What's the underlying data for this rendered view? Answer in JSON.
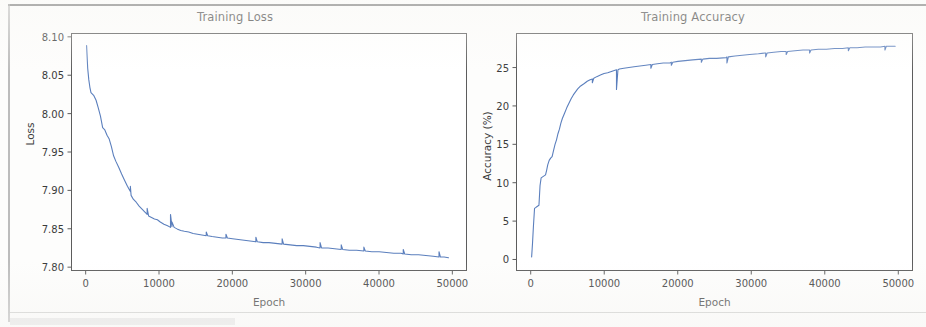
{
  "page": {
    "background_color": "#fdfdfc",
    "ink_color": "#3b3b3b"
  },
  "charts": {
    "loss": {
      "title": "Training Loss",
      "xlabel": "Epoch",
      "ylabel": "Loss"
    },
    "accuracy": {
      "title": "Training Accuracy",
      "xlabel": "Epoch",
      "ylabel": "Accuracy (%)"
    }
  },
  "chart_data": [
    {
      "type": "line",
      "title": "Training Loss",
      "xlabel": "Epoch",
      "ylabel": "Loss",
      "line_color": "#5b7fbd",
      "grid": false,
      "legend": null,
      "xlim": [
        -2000,
        52000
      ],
      "ylim": [
        7.795,
        8.105
      ],
      "xticks": [
        0,
        10000,
        20000,
        30000,
        40000,
        50000
      ],
      "xticklabels": [
        "0",
        "10000",
        "20000",
        "30000",
        "40000",
        "50000"
      ],
      "yticks": [
        7.8,
        7.85,
        7.9,
        7.95,
        8.0,
        8.05,
        8.1
      ],
      "yticklabels": [
        "7.80",
        "7.85",
        "7.90",
        "7.95",
        "8.00",
        "8.05",
        "8.10"
      ],
      "series": [
        {
          "name": "loss",
          "x": [
            0,
            150,
            300,
            450,
            600,
            800,
            1000,
            1300,
            1600,
            1900,
            2200,
            2500,
            2800,
            3100,
            3400,
            3700,
            4000,
            4400,
            4800,
            5200,
            5600,
            6000,
            6000,
            6100,
            6400,
            6800,
            7200,
            7600,
            8000,
            8300,
            8300,
            8500,
            8900,
            9300,
            9700,
            10100,
            10600,
            11100,
            11500,
            11500,
            11700,
            11700,
            12000,
            12400,
            12900,
            13400,
            14000,
            14600,
            15200,
            15800,
            16400,
            16400,
            16600,
            17200,
            17900,
            18600,
            19100,
            19100,
            19300,
            20000,
            20800,
            21600,
            22400,
            23200,
            23200,
            23400,
            24200,
            25000,
            25900,
            26800,
            26800,
            27000,
            27900,
            28800,
            29700,
            30600,
            31500,
            32000,
            32000,
            32200,
            33100,
            34000,
            34900,
            34900,
            35100,
            36000,
            37000,
            38000,
            38000,
            38200,
            39100,
            40100,
            41100,
            42100,
            43100,
            43400,
            43400,
            43600,
            44500,
            45500,
            46500,
            47500,
            48300,
            48300,
            48500,
            49000,
            49600
          ],
          "y": [
            8.09,
            8.06,
            8.045,
            8.035,
            8.028,
            8.026,
            8.024,
            8.018,
            8.008,
            7.997,
            7.982,
            7.979,
            7.972,
            7.967,
            7.957,
            7.945,
            7.938,
            7.93,
            7.921,
            7.913,
            7.905,
            7.898,
            7.905,
            7.893,
            7.888,
            7.884,
            7.879,
            7.875,
            7.871,
            7.868,
            7.876,
            7.866,
            7.864,
            7.862,
            7.861,
            7.858,
            7.855,
            7.853,
            7.851,
            7.868,
            7.852,
            7.858,
            7.851,
            7.849,
            7.847,
            7.846,
            7.845,
            7.843,
            7.842,
            7.841,
            7.84,
            7.845,
            7.84,
            7.839,
            7.838,
            7.837,
            7.837,
            7.842,
            7.837,
            7.836,
            7.835,
            7.834,
            7.833,
            7.832,
            7.838,
            7.832,
            7.831,
            7.831,
            7.83,
            7.829,
            7.836,
            7.829,
            7.828,
            7.827,
            7.827,
            7.826,
            7.825,
            7.824,
            7.831,
            7.824,
            7.824,
            7.823,
            7.822,
            7.828,
            7.822,
            7.821,
            7.821,
            7.82,
            7.825,
            7.82,
            7.819,
            7.819,
            7.818,
            7.817,
            7.817,
            7.816,
            7.822,
            7.816,
            7.815,
            7.815,
            7.814,
            7.813,
            7.812,
            7.819,
            7.812,
            7.812,
            7.811
          ]
        }
      ],
      "annotations": "Monotonically decreasing loss curve with periodic upward spikes every ~5000 epochs after epoch 6000"
    },
    {
      "type": "line",
      "title": "Training Accuracy",
      "xlabel": "Epoch",
      "ylabel": "Accuracy (%)",
      "line_color": "#5b7fbd",
      "grid": false,
      "legend": null,
      "xlim": [
        -2000,
        52000
      ],
      "ylim": [
        -1.5,
        29.5
      ],
      "xticks": [
        0,
        10000,
        20000,
        30000,
        40000,
        50000
      ],
      "xticklabels": [
        "0",
        "10000",
        "20000",
        "30000",
        "40000",
        "50000"
      ],
      "yticks": [
        0,
        5,
        10,
        15,
        20,
        25
      ],
      "yticklabels": [
        "0",
        "5",
        "10",
        "15",
        "20",
        "25"
      ],
      "series": [
        {
          "name": "accuracy",
          "x": [
            0,
            120,
            250,
            400,
            400,
            550,
            700,
            850,
            1000,
            1150,
            1300,
            1450,
            1600,
            1750,
            1900,
            2050,
            2200,
            2400,
            2600,
            2800,
            3000,
            3200,
            3400,
            3600,
            3800,
            4000,
            4200,
            4500,
            4800,
            5100,
            5400,
            5700,
            6000,
            6300,
            6600,
            6900,
            7200,
            7600,
            8000,
            8300,
            8300,
            8500,
            8900,
            9400,
            9900,
            10400,
            11000,
            11600,
            11600,
            11800,
            12000,
            12600,
            13300,
            14000,
            14800,
            15600,
            16300,
            16300,
            16500,
            17200,
            18000,
            18900,
            19100,
            19100,
            19300,
            20000,
            21000,
            22000,
            23200,
            23200,
            23400,
            24300,
            25300,
            26600,
            26700,
            26700,
            26900,
            27800,
            28800,
            29800,
            31000,
            31900,
            32000,
            32000,
            32200,
            33100,
            34100,
            34800,
            34800,
            35000,
            36000,
            37100,
            38000,
            38000,
            38200,
            39200,
            40300,
            41400,
            42500,
            43300,
            43300,
            43500,
            44500,
            45600,
            46700,
            47700,
            48300,
            48300,
            48500,
            49100,
            49700
          ],
          "y": [
            0.2,
            2.0,
            4.3,
            6.6,
            6.6,
            6.7,
            6.8,
            6.9,
            7.0,
            9.6,
            10.6,
            10.7,
            10.8,
            10.9,
            11.0,
            11.6,
            12.3,
            12.9,
            13.2,
            13.4,
            14.2,
            15.0,
            15.6,
            16.4,
            17.0,
            17.8,
            18.4,
            19.1,
            19.8,
            20.4,
            21.0,
            21.5,
            21.9,
            22.3,
            22.6,
            22.8,
            23.0,
            23.3,
            23.5,
            23.6,
            23.1,
            23.7,
            23.9,
            24.1,
            24.3,
            24.4,
            24.6,
            24.8,
            22.2,
            24.8,
            24.9,
            25.0,
            25.1,
            25.2,
            25.3,
            25.4,
            25.5,
            25.0,
            25.5,
            25.6,
            25.7,
            25.7,
            25.8,
            25.4,
            25.8,
            25.9,
            26.0,
            26.1,
            26.2,
            25.8,
            26.2,
            26.3,
            26.3,
            26.4,
            26.5,
            25.7,
            26.5,
            26.6,
            26.7,
            26.8,
            26.9,
            27.0,
            27.0,
            26.5,
            27.0,
            27.1,
            27.2,
            27.2,
            26.8,
            27.2,
            27.3,
            27.4,
            27.4,
            27.0,
            27.4,
            27.5,
            27.5,
            27.6,
            27.6,
            27.7,
            27.3,
            27.7,
            27.7,
            27.8,
            27.8,
            27.8,
            27.9,
            27.4,
            27.9,
            27.9,
            27.9
          ]
        }
      ],
      "annotations": "Rapidly rising accuracy curve saturating near 28%, with periodic downward dips every ~5000 epochs"
    }
  ]
}
